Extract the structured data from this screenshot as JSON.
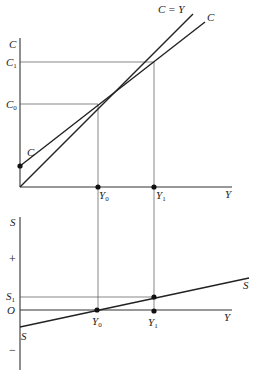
{
  "figure": {
    "type": "keynesian-cross-consumption-savings",
    "top_panel": {
      "y_axis_label": "C",
      "x_axis_label": "Y",
      "y_ticks": [
        {
          "label": "C",
          "sub": "1",
          "name": "C1"
        },
        {
          "label": "C",
          "sub": "0",
          "name": "C0"
        }
      ],
      "x_ticks": [
        {
          "label": "Y",
          "sub": "0",
          "name": "Y0"
        },
        {
          "label": "Y",
          "sub": "1",
          "name": "Y1"
        }
      ],
      "lines": [
        {
          "name": "45-degree-line",
          "label": "C = Y"
        },
        {
          "name": "consumption-function",
          "label": "C"
        }
      ],
      "intercept_label": "C"
    },
    "bottom_panel": {
      "y_axis_label": "S",
      "x_axis_label": "Y",
      "plus_sign": "+",
      "minus_sign": "−",
      "y_ticks": [
        {
          "label": "S",
          "sub": "1",
          "name": "S1"
        },
        {
          "label": "O",
          "sub": "",
          "name": "origin"
        }
      ],
      "x_ticks": [
        {
          "label": "Y",
          "sub": "0",
          "name": "Y0"
        },
        {
          "label": "Y",
          "sub": "1",
          "name": "Y1"
        }
      ],
      "lines": [
        {
          "name": "savings-function",
          "label": "S"
        }
      ],
      "intercept_label": "S"
    }
  },
  "geometry": {
    "top": {
      "origin": [
        20,
        187
      ],
      "axis_top": 40,
      "axis_right": 232,
      "c0_y": 104,
      "c1_y": 62,
      "y0_x": 98,
      "y1_x": 154,
      "intercept_y": 166,
      "cy_line_end": [
        193,
        14
      ],
      "c_line_end": [
        205,
        22
      ]
    },
    "bottom": {
      "axis_x": 20,
      "axis_top": 218,
      "axis_bottom": 370,
      "zero_y": 310,
      "s1_y": 297,
      "s_start": [
        20,
        327
      ],
      "s_end": [
        249,
        278
      ],
      "axis_right": 232
    }
  }
}
